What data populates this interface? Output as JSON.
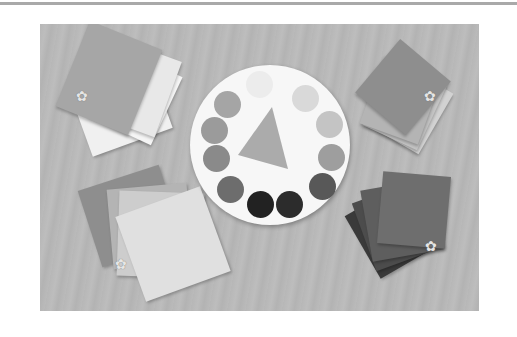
{
  "image": {
    "description": "Grayscale photo of colored paper card swatches fanned in four corners around a white color wheel with twelve circles and a central triangle, on a textured background",
    "colors": {
      "background": "#b8b8b8",
      "wheel": "#f7f7f7",
      "rule": "#a9a9a9"
    },
    "wheel_dots": [
      "#ececec",
      "#d9d9d9",
      "#c4c4c4",
      "#9e9e9e",
      "#6d6d6d",
      "#2c2c2c",
      "#222222",
      "#585858",
      "#8a8a8a",
      "#9b9b9b",
      "#a5a5a5",
      "#ababab"
    ],
    "stacks": {
      "top_left": [
        "#f0f0f0",
        "#f5f5f5",
        "#e8e8e8",
        "#a6a6a6"
      ],
      "top_right": [
        "#d2d2d2",
        "#c4c4c4",
        "#b4b4b4",
        "#8e8e8e"
      ],
      "bottom_left": [
        "#8e8e8e",
        "#b4b4b4",
        "#cdcdcd",
        "#e0e0e0"
      ],
      "bottom_right": [
        "#3a3a3a",
        "#4c4c4c",
        "#5e5e5e",
        "#6e6e6e"
      ]
    },
    "flower_glyph": "✿"
  }
}
